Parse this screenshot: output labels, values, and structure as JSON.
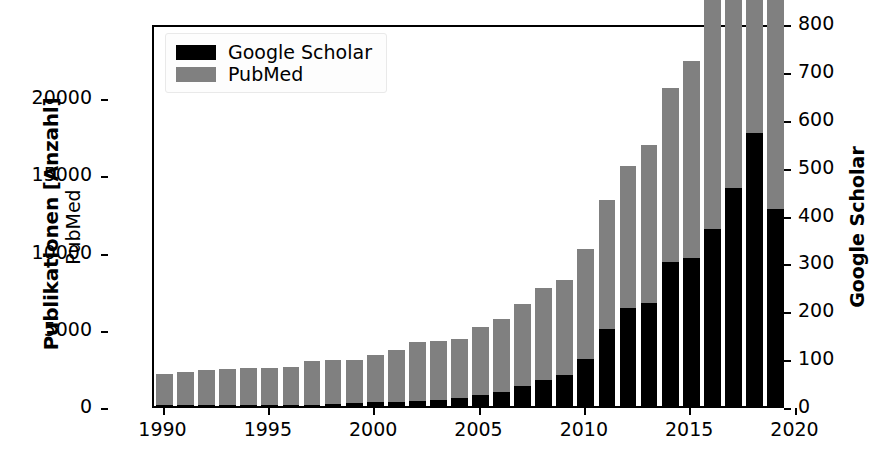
{
  "chart_data": {
    "type": "bar",
    "stacked": true,
    "title": "",
    "xlabel": "",
    "ylabel": "Publikationen [Anzahl]",
    "ylabel_secondary_left": "PubMed",
    "ylabel_right": "Google Scholar",
    "grid": false,
    "legend_position": "upper left",
    "xlim": [
      1989.5,
      2019.5
    ],
    "ylim": [
      0,
      24800
    ],
    "ylim_right": [
      0,
      800
    ],
    "yticks": [
      0,
      5000,
      10000,
      15000,
      20000
    ],
    "ytick_labels": [
      "0",
      "5000",
      "10000",
      "15000",
      "20000"
    ],
    "yticks_right": [
      0,
      100,
      200,
      300,
      400,
      500,
      600,
      700,
      800
    ],
    "ytick_labels_right": [
      "0",
      "100",
      "200",
      "300",
      "400",
      "500",
      "600",
      "700",
      "800"
    ],
    "xticks": [
      1990,
      1995,
      2000,
      2005,
      2010,
      2015,
      2020
    ],
    "xtick_labels": [
      "1990",
      "1995",
      "2000",
      "2005",
      "2010",
      "2015",
      "2020"
    ],
    "categories": [
      1990,
      1991,
      1992,
      1993,
      1994,
      1995,
      1996,
      1997,
      1998,
      1999,
      2000,
      2001,
      2002,
      2003,
      2004,
      2005,
      2006,
      2007,
      2008,
      2009,
      2010,
      2011,
      2012,
      2013,
      2014,
      2015,
      2016,
      2017,
      2018,
      2019
    ],
    "series": [
      {
        "name": "Google Scholar",
        "color": "#000000",
        "axis": "right",
        "unit_scale_to_left_axis": 31,
        "values": [
          2,
          2,
          2,
          2,
          2,
          3,
          3,
          3,
          4,
          6,
          8,
          9,
          10,
          13,
          17,
          22,
          30,
          42,
          55,
          64,
          98,
          160,
          205,
          215,
          300,
          310,
          370,
          455,
          570,
          412
        ]
      },
      {
        "name": "PubMed",
        "color": "#808080",
        "axis": "left",
        "values": [
          2000,
          2150,
          2250,
          2350,
          2400,
          2400,
          2450,
          2800,
          2850,
          2800,
          3050,
          3350,
          3850,
          3800,
          3800,
          4450,
          4700,
          5300,
          5950,
          6150,
          7150,
          8400,
          9200,
          10250,
          11300,
          12700,
          15200,
          17200,
          18450,
          19850
        ]
      }
    ],
    "bar_totals_left_axis": [
      2060,
      2210,
      2310,
      2410,
      2460,
      2490,
      2540,
      2890,
      2970,
      2990,
      3300,
      3630,
      4160,
      4200,
      4330,
      5130,
      5630,
      6600,
      7650,
      8130,
      9370,
      11360,
      15550,
      16900,
      18600,
      22300,
      26670,
      31300,
      36170,
      32620
    ]
  },
  "legend": {
    "items": [
      {
        "label": "Google Scholar",
        "color": "#000000",
        "swatch": "legend-swatch-black"
      },
      {
        "label": "PubMed",
        "color": "#808080",
        "swatch": "legend-swatch-gray"
      }
    ]
  },
  "axes": {
    "left_title_bold": "Publikationen [Anzahl]",
    "left_title_sub": "PubMed",
    "right_title": "Google Scholar",
    "left_ticks": [
      "0",
      "5000",
      "10000",
      "15000",
      "20000"
    ],
    "right_ticks": [
      "0",
      "100",
      "200",
      "300",
      "400",
      "500",
      "600",
      "700",
      "800"
    ],
    "x_ticks": [
      "1990",
      "1995",
      "2000",
      "2005",
      "2010",
      "2015",
      "2020"
    ]
  },
  "colors": {
    "google_scholar": "#000000",
    "pubmed": "#808080",
    "axis": "#000000",
    "background": "#ffffff"
  }
}
